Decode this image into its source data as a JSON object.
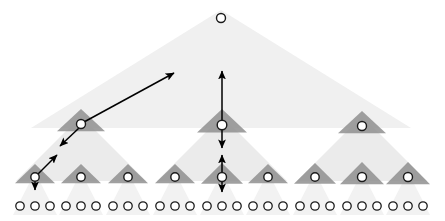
{
  "figure": {
    "width": 445,
    "height": 221,
    "background": "#ffffff",
    "colors": {
      "triangle_level0": "#f0f0f0",
      "triangle_level1": "#ebebeb",
      "triangle_level2": "#efefef",
      "triangle_node_small": "#8f8f8f",
      "node_fill": "#ffffff",
      "node_stroke": "#1a1a1a",
      "arrow": "#000000"
    }
  },
  "tree": {
    "levels": 4,
    "branching_factor": 3,
    "root": {
      "name": "root-node",
      "x": 221,
      "y": 18,
      "r": 4.5
    },
    "level1_nodes": [
      {
        "name": "level1-node-left",
        "x": 81,
        "y": 124,
        "r": 4.5,
        "tri_w": 48,
        "tri_h": 17
      },
      {
        "name": "level1-node-center",
        "x": 222,
        "y": 125,
        "r": 4.8,
        "tri_w": 50,
        "tri_h": 18
      },
      {
        "name": "level1-node-right",
        "x": 362,
        "y": 126,
        "r": 4.5,
        "tri_w": 48,
        "tri_h": 17
      }
    ],
    "level2_nodes": [
      {
        "name": "level2-node-1",
        "x": 35,
        "y": 177,
        "r": 4.2,
        "tri_w": 40,
        "tri_h": 15
      },
      {
        "name": "level2-node-2",
        "x": 81,
        "y": 177,
        "r": 4.2,
        "tri_w": 40,
        "tri_h": 15
      },
      {
        "name": "level2-node-3",
        "x": 128,
        "y": 177,
        "r": 4.2,
        "tri_w": 40,
        "tri_h": 15
      },
      {
        "name": "level2-node-4",
        "x": 175,
        "y": 177,
        "r": 4.2,
        "tri_w": 40,
        "tri_h": 15
      },
      {
        "name": "level2-node-5",
        "x": 222,
        "y": 177,
        "r": 4.5,
        "tri_w": 42,
        "tri_h": 16
      },
      {
        "name": "level2-node-6",
        "x": 268,
        "y": 177,
        "r": 4.2,
        "tri_w": 40,
        "tri_h": 15
      },
      {
        "name": "level2-node-7",
        "x": 315,
        "y": 177,
        "r": 4.2,
        "tri_w": 42,
        "tri_h": 16
      },
      {
        "name": "level2-node-8",
        "x": 362,
        "y": 177,
        "r": 4.5,
        "tri_w": 44,
        "tri_h": 17
      },
      {
        "name": "level2-node-9",
        "x": 408,
        "y": 177,
        "r": 4.5,
        "tri_w": 44,
        "tri_h": 17
      }
    ],
    "leaf_groups": [
      {
        "name": "leaf-group-1",
        "cx": 35,
        "y": 206
      },
      {
        "name": "leaf-group-2",
        "cx": 81,
        "y": 206
      },
      {
        "name": "leaf-group-3",
        "cx": 128,
        "y": 206
      },
      {
        "name": "leaf-group-4",
        "cx": 175,
        "y": 206
      },
      {
        "name": "leaf-group-5",
        "cx": 222,
        "y": 206
      },
      {
        "name": "leaf-group-6",
        "cx": 268,
        "y": 206
      },
      {
        "name": "leaf-group-7",
        "cx": 315,
        "y": 206
      },
      {
        "name": "leaf-group-8",
        "cx": 362,
        "y": 206
      },
      {
        "name": "leaf-group-9",
        "cx": 408,
        "y": 206
      }
    ],
    "leaf_spacing": 15,
    "leaf_radius": 4.2,
    "leaves_per_group": 3
  },
  "big_triangles": [
    {
      "name": "triangle-root-span",
      "apex_x": 221,
      "apex_y": 10,
      "base_y": 128,
      "half_width": 190,
      "fill": "#f0f0f0"
    },
    {
      "name": "triangle-level1-left",
      "apex_x": 81,
      "apex_y": 116,
      "base_y": 181,
      "half_width": 65,
      "fill": "#ebebeb"
    },
    {
      "name": "triangle-level1-center",
      "apex_x": 222,
      "apex_y": 116,
      "base_y": 181,
      "half_width": 65,
      "fill": "#ebebeb"
    },
    {
      "name": "triangle-level1-right",
      "apex_x": 362,
      "apex_y": 116,
      "base_y": 181,
      "half_width": 65,
      "fill": "#ebebeb"
    },
    {
      "name": "triangle-leaf-1",
      "apex_x": 35,
      "apex_y": 172,
      "base_y": 215,
      "half_width": 22,
      "fill": "#f2f2f2"
    },
    {
      "name": "triangle-leaf-2",
      "apex_x": 81,
      "apex_y": 172,
      "base_y": 215,
      "half_width": 22,
      "fill": "#f2f2f2"
    },
    {
      "name": "triangle-leaf-3",
      "apex_x": 128,
      "apex_y": 172,
      "base_y": 215,
      "half_width": 22,
      "fill": "#f2f2f2"
    },
    {
      "name": "triangle-leaf-4",
      "apex_x": 175,
      "apex_y": 172,
      "base_y": 215,
      "half_width": 22,
      "fill": "#f2f2f2"
    },
    {
      "name": "triangle-leaf-5",
      "apex_x": 222,
      "apex_y": 172,
      "base_y": 215,
      "half_width": 22,
      "fill": "#f2f2f2"
    },
    {
      "name": "triangle-leaf-6",
      "apex_x": 268,
      "apex_y": 172,
      "base_y": 215,
      "half_width": 22,
      "fill": "#f2f2f2"
    },
    {
      "name": "triangle-leaf-7",
      "apex_x": 315,
      "apex_y": 172,
      "base_y": 215,
      "half_width": 22,
      "fill": "#f2f2f2"
    },
    {
      "name": "triangle-leaf-8",
      "apex_x": 362,
      "apex_y": 172,
      "base_y": 215,
      "half_width": 22,
      "fill": "#f2f2f2"
    },
    {
      "name": "triangle-leaf-9",
      "apex_x": 408,
      "apex_y": 172,
      "base_y": 215,
      "half_width": 22,
      "fill": "#f2f2f2"
    }
  ],
  "arrows": [
    {
      "name": "arrow-level1-up-right",
      "description": "long diagonal arrow from left level-1 node up toward root region",
      "x1": 84,
      "y1": 122,
      "x2": 174,
      "y2": 73,
      "head_start": false,
      "head_end": true
    },
    {
      "name": "arrow-level1-down-left",
      "description": "short diagonal arrow from left level-1 node down-left",
      "x1": 79,
      "y1": 128,
      "x2": 60,
      "y2": 146,
      "head_start": false,
      "head_end": true
    },
    {
      "name": "arrow-level2-up-right",
      "description": "diagonal arrow from leftmost level-2 node up-right",
      "x1": 38,
      "y1": 174,
      "x2": 57,
      "y2": 155,
      "head_start": false,
      "head_end": true
    },
    {
      "name": "arrow-level2-down-stub",
      "description": "short downward arrow below leftmost level-2 node",
      "x1": 35,
      "y1": 177,
      "x2": 35,
      "y2": 190,
      "head_start": false,
      "head_end": true
    },
    {
      "name": "arrow-center-vertical-upper",
      "description": "double-headed vertical arrow through center level-1 node",
      "x1": 222,
      "y1": 148,
      "x2": 222,
      "y2": 71,
      "head_start": true,
      "head_end": true
    },
    {
      "name": "arrow-center-vertical-lower",
      "description": "double-headed vertical arrow through center level-2 node",
      "x1": 222,
      "y1": 192,
      "x2": 222,
      "y2": 155,
      "head_start": true,
      "head_end": true
    }
  ]
}
